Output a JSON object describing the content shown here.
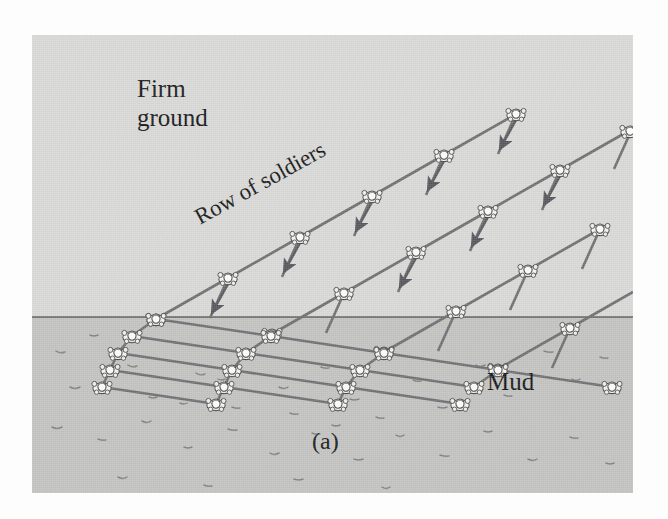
{
  "figure": {
    "caption": "(a)",
    "labels": {
      "firm_ground": "Firm\nground",
      "mud": "Mud",
      "row_of_soldiers": "Row of soldiers"
    },
    "colors": {
      "firm_ground_fill": "#d9d9d7",
      "mud_fill": "#c2c2c0",
      "boundary_line": "#5a5a5a",
      "rank_line": "#6e6e72",
      "soldier_body": "#f2f2f0",
      "soldier_outline": "#4a4a4a",
      "arrow": "#58585c",
      "text": "#161616",
      "page_background": "#fdfdfd"
    },
    "panel": {
      "x": 32,
      "y": 35,
      "width": 601,
      "height": 458
    },
    "boundary_y": 282,
    "text_positions": {
      "firm_ground": {
        "x": 105,
        "y": 45
      },
      "row_of_soldiers": {
        "x": 175,
        "y": 175,
        "rotation_deg": -29
      },
      "mud": {
        "x": 455,
        "y": 340
      },
      "caption": {
        "x": 282,
        "y": 400
      }
    }
  },
  "chart_data": {
    "type": "diagram",
    "regions": [
      {
        "name": "Firm ground",
        "fill": "#d9d9d7",
        "bounds": [
          0,
          0,
          601,
          282
        ]
      },
      {
        "name": "Mud",
        "fill": "#c2c2c0",
        "bounds": [
          0,
          282,
          601,
          458
        ]
      }
    ],
    "boundary": {
      "y": 282,
      "color": "#5a5a5a",
      "width": 1.4
    },
    "rank_count": 5,
    "soldiers_per_rank": 7,
    "rank_direction_firm_deg": -30,
    "rank_direction_mud_deg": -9,
    "march_arrow_direction_deg": 60,
    "grid": {
      "comment": "Node coordinates in panel space. Each rank is a line of soldiers; ranks refract at boundary_y.",
      "ranks": [
        {
          "index": 0,
          "nodes": [
            [
              124,
              284
            ],
            [
              243,
              284
            ],
            [
              358,
              284
            ],
            [
              470,
              284
            ],
            [
              585,
              284
            ],
            [
              700,
              284
            ],
            [
              815,
              284
            ]
          ]
        }
      ]
    },
    "geometry": {
      "firm_spacing": 84,
      "mud_spacing": 62,
      "rank_offset_firm": 70,
      "rank_offset_mud": 34,
      "origin": [
        124,
        284
      ]
    },
    "annotations": [
      {
        "text": "Firm ground",
        "x": 105,
        "y": 58
      },
      {
        "text": "Row of soldiers",
        "x": 175,
        "y": 175,
        "rotation": -29
      },
      {
        "text": "Mud",
        "x": 455,
        "y": 352
      },
      {
        "text": "(a)",
        "x": 282,
        "y": 412
      }
    ]
  }
}
